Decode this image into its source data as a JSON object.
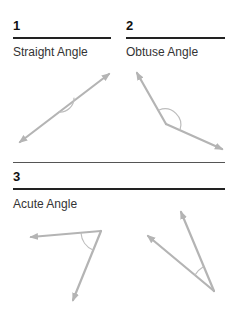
{
  "panels": [
    {
      "number": "1",
      "title": "Straight Angle"
    },
    {
      "number": "2",
      "title": "Obtuse Angle"
    },
    {
      "number": "3",
      "title": "Acute Angle"
    }
  ],
  "colors": {
    "ray": "#b4b4b4",
    "arc": "#b8b8b8",
    "rule": "#222222",
    "text": "#333333"
  }
}
